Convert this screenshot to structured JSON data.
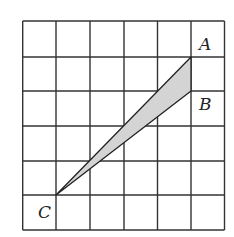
{
  "diagram": {
    "grid": {
      "cols": 6,
      "rows": 6,
      "x_lines": [
        22.7,
        56,
        90,
        124,
        157.5,
        191,
        224.5
      ],
      "y_lines": [
        21,
        57,
        91,
        126,
        161,
        195,
        230
      ],
      "line_color": "#333333"
    },
    "points": [
      {
        "name": "A",
        "label": "A",
        "x": 191,
        "y": 57,
        "label_x": 199,
        "label_y": 50
      },
      {
        "name": "B",
        "label": "B",
        "x": 191,
        "y": 91,
        "label_x": 199,
        "label_y": 110
      },
      {
        "name": "C",
        "label": "C",
        "x": 56,
        "y": 195,
        "label_x": 38,
        "label_y": 218
      }
    ],
    "triangle": {
      "vertices": [
        "A",
        "B",
        "C"
      ],
      "fill": "#d4d4d4",
      "stroke": "#222222"
    }
  }
}
